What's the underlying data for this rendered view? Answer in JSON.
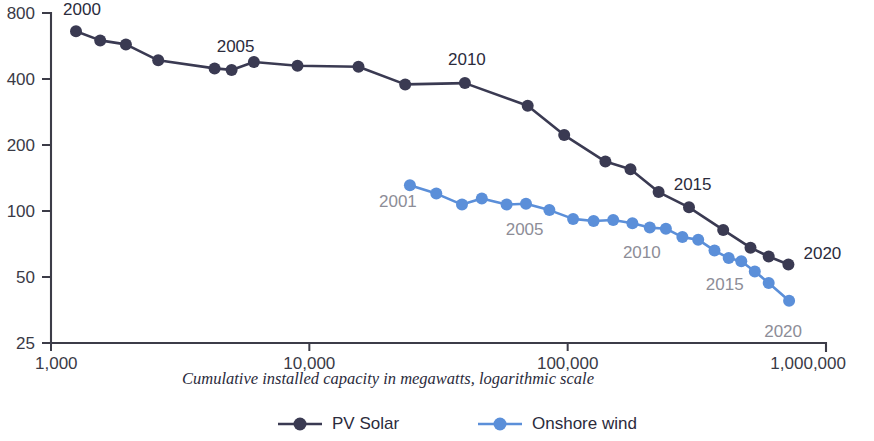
{
  "chart_data": {
    "type": "line",
    "title": "",
    "xlabel": "Cumulative installed capacity in megawatts, logarithmic scale",
    "ylabel": "",
    "xscale": "log",
    "yscale": "log",
    "xlim": [
      1000,
      1000000
    ],
    "ylim": [
      25,
      800
    ],
    "xticks": [
      1000,
      10000,
      100000,
      1000000
    ],
    "xtick_labels": [
      "1,000",
      "10,000",
      "100,000",
      "1,000,000"
    ],
    "yticks": [
      25,
      50,
      100,
      200,
      400,
      800
    ],
    "ytick_labels": [
      "25",
      "50",
      "100",
      "200",
      "400",
      "800"
    ],
    "grid": false,
    "legend_position": "bottom",
    "series": [
      {
        "name": "PV Solar",
        "color": "#3a3a52",
        "points": [
          {
            "x": 1250,
            "y": 660
          },
          {
            "x": 1550,
            "y": 600
          },
          {
            "x": 1950,
            "y": 575
          },
          {
            "x": 2600,
            "y": 487
          },
          {
            "x": 4300,
            "y": 447
          },
          {
            "x": 5000,
            "y": 440
          },
          {
            "x": 6100,
            "y": 478
          },
          {
            "x": 9000,
            "y": 460
          },
          {
            "x": 15500,
            "y": 455
          },
          {
            "x": 23500,
            "y": 378
          },
          {
            "x": 40000,
            "y": 383
          },
          {
            "x": 70000,
            "y": 302
          },
          {
            "x": 97000,
            "y": 222
          },
          {
            "x": 140000,
            "y": 168
          },
          {
            "x": 175000,
            "y": 155
          },
          {
            "x": 225000,
            "y": 122
          },
          {
            "x": 295000,
            "y": 104
          },
          {
            "x": 400000,
            "y": 82
          },
          {
            "x": 510000,
            "y": 68
          },
          {
            "x": 600000,
            "y": 62
          },
          {
            "x": 715000,
            "y": 57
          }
        ],
        "annotations": [
          {
            "label": "2000",
            "x": 1250,
            "y": 660
          },
          {
            "label": "2005",
            "x": 5000,
            "y": 440
          },
          {
            "label": "2010",
            "x": 40000,
            "y": 383
          },
          {
            "label": "2015",
            "x": 225000,
            "y": 122
          },
          {
            "label": "2020",
            "x": 715000,
            "y": 57
          }
        ]
      },
      {
        "name": "Onshore wind",
        "color": "#5b8fd9",
        "points": [
          {
            "x": 24500,
            "y": 131
          },
          {
            "x": 31000,
            "y": 120
          },
          {
            "x": 39000,
            "y": 107
          },
          {
            "x": 46500,
            "y": 114
          },
          {
            "x": 58000,
            "y": 107
          },
          {
            "x": 69000,
            "y": 108
          },
          {
            "x": 85000,
            "y": 101
          },
          {
            "x": 105000,
            "y": 92
          },
          {
            "x": 126000,
            "y": 90
          },
          {
            "x": 150000,
            "y": 91
          },
          {
            "x": 178000,
            "y": 88
          },
          {
            "x": 208000,
            "y": 84
          },
          {
            "x": 240000,
            "y": 83
          },
          {
            "x": 278000,
            "y": 76
          },
          {
            "x": 320000,
            "y": 74
          },
          {
            "x": 370000,
            "y": 66
          },
          {
            "x": 420000,
            "y": 61
          },
          {
            "x": 470000,
            "y": 59
          },
          {
            "x": 530000,
            "y": 53
          },
          {
            "x": 600000,
            "y": 47
          },
          {
            "x": 720000,
            "y": 39
          }
        ],
        "annotations": [
          {
            "label": "2001",
            "x": 24500,
            "y": 131
          },
          {
            "label": "2005",
            "x": 58000,
            "y": 107
          },
          {
            "label": "2010",
            "x": 208000,
            "y": 84
          },
          {
            "label": "2015",
            "x": 420000,
            "y": 61
          },
          {
            "label": "2020",
            "x": 720000,
            "y": 39
          }
        ]
      }
    ]
  },
  "legend": {
    "items": [
      {
        "label": "PV Solar",
        "color": "#3a3a52"
      },
      {
        "label": "Onshore wind",
        "color": "#5b8fd9"
      }
    ]
  }
}
